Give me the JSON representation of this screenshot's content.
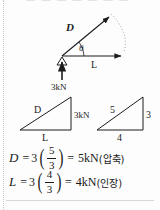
{
  "page": {
    "header_remnant": "— — —  — —  — —",
    "background": "#fdfdfd",
    "ink": "#1c1c1c"
  },
  "force_diagram": {
    "name": "force-vector-diagram",
    "vector_d_label": "D",
    "angle_label": "θ",
    "vector_l_label": "L",
    "applied_load_label": "3kN",
    "support_type": "pin-support-triangle",
    "arc_style": "dotted"
  },
  "triangle_force": {
    "name": "force-triangle",
    "hypotenuse_label": "D",
    "vertical_label": "3kN",
    "base_label": "L"
  },
  "triangle_ratio": {
    "name": "ratio-triangle-3-4-5",
    "hypotenuse_label": "5",
    "vertical_label": "3",
    "base_label": "4"
  },
  "equations": [
    {
      "variable": "D",
      "equals": "=",
      "coefficient": "3",
      "numerator": "5",
      "denominator": "3",
      "equals2": "=",
      "result": "5kN",
      "annotation": "(압축)"
    },
    {
      "variable": "L",
      "equals": "=",
      "coefficient": "3",
      "numerator": "4",
      "denominator": "3",
      "equals2": "=",
      "result": "4kN",
      "annotation": "(인장)"
    }
  ]
}
